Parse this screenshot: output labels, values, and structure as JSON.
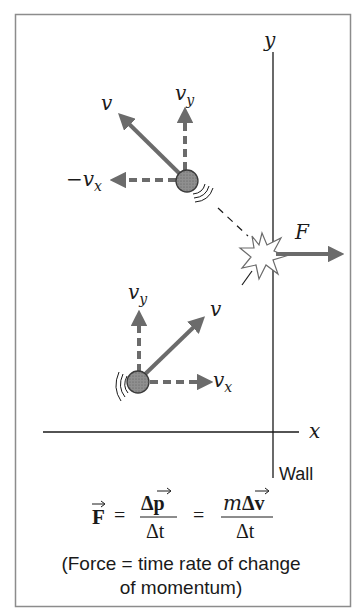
{
  "colors": {
    "frame": "#8c8c8c",
    "axis": "#1a1a1a",
    "arrow": "#6b6b6b",
    "ball_fill": "#8a8a8a",
    "ball_stroke": "#3a3a3a",
    "text": "#1a1a1a"
  },
  "axes": {
    "y_label": "y",
    "x_label": "x",
    "wall_label": "Wall"
  },
  "incoming_ball": {
    "v_label": "v",
    "vy_label": "v",
    "vy_sub": "y",
    "vx_label": "v",
    "vx_sub": "x"
  },
  "outgoing_ball": {
    "v_label": "v",
    "vy_label": "v",
    "vy_sub": "y",
    "neg_vx_prefix": "−",
    "neg_vx_label": "v",
    "neg_vx_sub": "x"
  },
  "force": {
    "label": "F"
  },
  "formula": {
    "lhs": "F",
    "eq1": "=",
    "frac1_num": "Δp",
    "frac1_den": "Δt",
    "eq2": "=",
    "frac2_num_m": "m",
    "frac2_num_rest": "Δv",
    "frac2_den": "Δt"
  },
  "caption": {
    "line1": "(Force = time rate of change",
    "line2": "of momentum)"
  }
}
